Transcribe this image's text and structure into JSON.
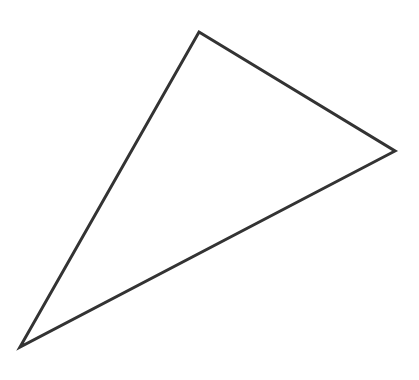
{
  "figure": {
    "shape": "triangle",
    "vertices": [
      {
        "name": "top",
        "x": 199,
        "y": 32
      },
      {
        "name": "right",
        "x": 395,
        "y": 151
      },
      {
        "name": "bottom-left",
        "x": 20,
        "y": 347
      }
    ],
    "stroke_color": "#333333",
    "stroke_width": 3,
    "fill_color": "none",
    "background_color": "#ffffff"
  }
}
